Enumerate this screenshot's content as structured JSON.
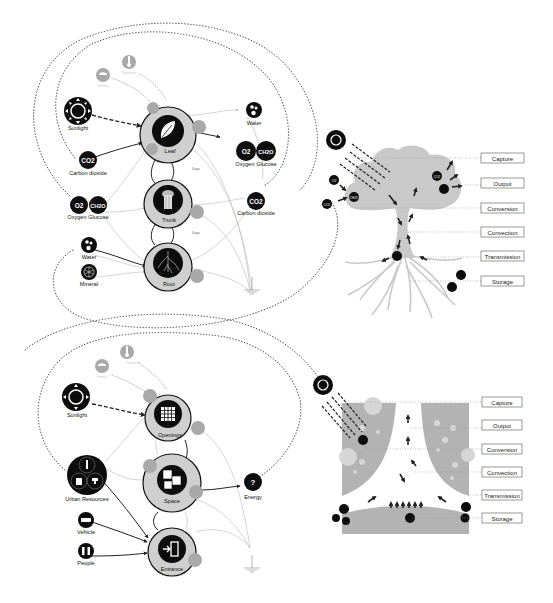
{
  "colors": {
    "background": "#ffffff",
    "node_black": "#0d0d0d",
    "ring_gray": "#cfcfcf",
    "satellite_gray": "#a9a9a9",
    "tree_gray": "#c9c9c9",
    "building_gray": "#b3b3b3"
  },
  "natural_system": {
    "core_nodes": [
      {
        "id": "leaf",
        "label": "Leaf",
        "icon": "leaf-icon"
      },
      {
        "id": "trunk",
        "label": "Trunk",
        "icon": "trunk-icon"
      },
      {
        "id": "root",
        "label": "Root",
        "icon": "roots-icon"
      }
    ],
    "inputs": {
      "temperature": "Temperature",
      "humidity": "Humidity",
      "sunlight": "Sunlight",
      "co2_label": "CO2",
      "carbon_dioxide": "Carbon dioxide",
      "o2": "O2",
      "ch2o": "CH2O",
      "oxygen_glucose": "Oxygen Glucose",
      "water": "Water",
      "mineral": "Mineral"
    },
    "outputs": {
      "water": "Water",
      "o2": "O2",
      "ch2o": "CH2O",
      "oxygen_glucose": "Oxygen Glucose",
      "co2": "CO2",
      "carbon_dioxide": "Carbon dioxide"
    },
    "flow_labels": {
      "sugar_1": "Sugar",
      "sugar_2": "Sugar"
    }
  },
  "tree_section": {
    "small_nodes": {
      "o2": "O2",
      "co2": "CO2",
      "ch2o": "CH2O"
    },
    "stages": [
      "Capture",
      "Output",
      "Conversion",
      "Convection",
      "Transmission",
      "Storage"
    ]
  },
  "urban_system": {
    "core_nodes": [
      {
        "id": "openings",
        "label": "Openings",
        "icon": "window-grid-icon"
      },
      {
        "id": "space",
        "label": "Space",
        "icon": "cubes-icon"
      },
      {
        "id": "entrance",
        "label": "Entrance",
        "icon": "entrance-icon"
      }
    ],
    "inputs": {
      "temperature": "Temperature",
      "humidity": "Humidity",
      "sunlight": "Sunlight",
      "urban_resources": "Urban Resources",
      "vehicle": "Vehicle",
      "people": "People"
    },
    "outputs": {
      "energy": "Energy",
      "energy_symbol": "?"
    }
  },
  "building_section": {
    "stages": [
      "Capture",
      "Output",
      "Conversion",
      "Convection",
      "Transmission",
      "Storage"
    ]
  }
}
